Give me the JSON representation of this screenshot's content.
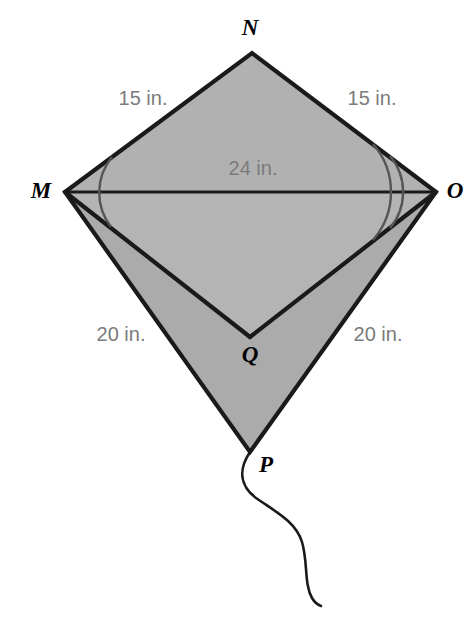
{
  "figure": {
    "background_color": "#ffffff",
    "fill_color": "#b0b0b0",
    "fill_color_lower": "#ababab",
    "stroke_color": "#1a1a1a",
    "measure_text_color": "#7b7b7b",
    "vertex_text_color": "#000000",
    "unit": "in."
  },
  "vertices": [
    {
      "id": "M",
      "label": "M",
      "x": 65,
      "y": 192,
      "label_x": 41,
      "label_y": 190
    },
    {
      "id": "N",
      "label": "N",
      "x": 252,
      "y": 53,
      "label_x": 250,
      "label_y": 27
    },
    {
      "id": "O",
      "label": "O",
      "x": 436,
      "y": 192,
      "label_x": 455,
      "label_y": 190
    },
    {
      "id": "P",
      "label": "P",
      "x": 250,
      "y": 452,
      "label_x": 266,
      "label_y": 464
    },
    {
      "id": "Q",
      "label": "Q",
      "x": 250,
      "y": 337,
      "label_x": 250,
      "label_y": 354
    }
  ],
  "measures": [
    {
      "id": "mn",
      "segment": "NM",
      "value": 15,
      "text": "15 in.",
      "x": 143,
      "y": 98
    },
    {
      "id": "no",
      "segment": "NO",
      "value": 15,
      "text": "15 in.",
      "x": 372,
      "y": 98
    },
    {
      "id": "mo",
      "segment": "MO",
      "value": 24,
      "text": "24 in.",
      "x": 253,
      "y": 168
    },
    {
      "id": "mp",
      "segment": "MP",
      "value": 20,
      "text": "20 in.",
      "x": 121,
      "y": 334
    },
    {
      "id": "po",
      "segment": "PO",
      "value": 20,
      "text": "20 in.",
      "x": 378,
      "y": 334
    }
  ],
  "angle_marks": [
    {
      "id": "angle-m",
      "at_vertex": "M",
      "arc_count": 1,
      "radii": [
        56
      ]
    },
    {
      "id": "angle-o",
      "at_vertex": "O",
      "arc_count": 2,
      "radii": [
        56,
        73
      ]
    }
  ],
  "string": {
    "description": "kite string hanging from vertex P",
    "start": {
      "x": 250,
      "y": 452
    },
    "end": {
      "x": 320,
      "y": 606
    }
  }
}
